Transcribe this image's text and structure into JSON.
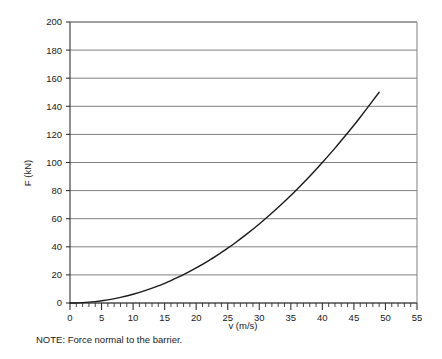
{
  "chart_data": {
    "type": "line",
    "title": "",
    "xlabel": "v (m/s)",
    "ylabel": "F (kN)",
    "xlim": [
      0,
      55
    ],
    "ylim": [
      0,
      200
    ],
    "grid": true,
    "legend": null,
    "x_ticks": [
      0,
      5,
      10,
      15,
      20,
      25,
      30,
      35,
      40,
      45,
      50,
      55
    ],
    "y_ticks": [
      0,
      20,
      40,
      60,
      80,
      100,
      120,
      140,
      160,
      180,
      200
    ],
    "x_minor_tick_step": 1,
    "series": [
      {
        "name": "Force vs speed",
        "color": "#1a1a1a",
        "x": [
          0,
          2,
          4,
          6,
          8,
          10,
          12,
          14,
          15,
          16,
          18,
          20,
          22,
          24,
          25,
          26,
          28,
          30,
          32,
          34,
          35,
          36,
          38,
          40,
          42,
          44,
          45,
          46,
          48,
          49
        ],
        "y": [
          0,
          0.25,
          1.0,
          2.2,
          4.0,
          6.2,
          9.0,
          12.2,
          14.0,
          16.0,
          20.2,
          25.0,
          30.2,
          36.0,
          39.0,
          42.2,
          49.0,
          56.2,
          64.0,
          72.2,
          76.5,
          81.0,
          90.2,
          100.0,
          110.2,
          121.0,
          126.5,
          132.2,
          144.0,
          150.0
        ]
      }
    ],
    "note": "NOTE: Force normal to the barrier."
  },
  "axis": {
    "y_title": "F (kN)",
    "x_title": "v (m/s)"
  },
  "colors": {
    "curve": "#1a1a1a",
    "axis": "#333333",
    "grid": "#808080",
    "background": "#ffffff"
  }
}
